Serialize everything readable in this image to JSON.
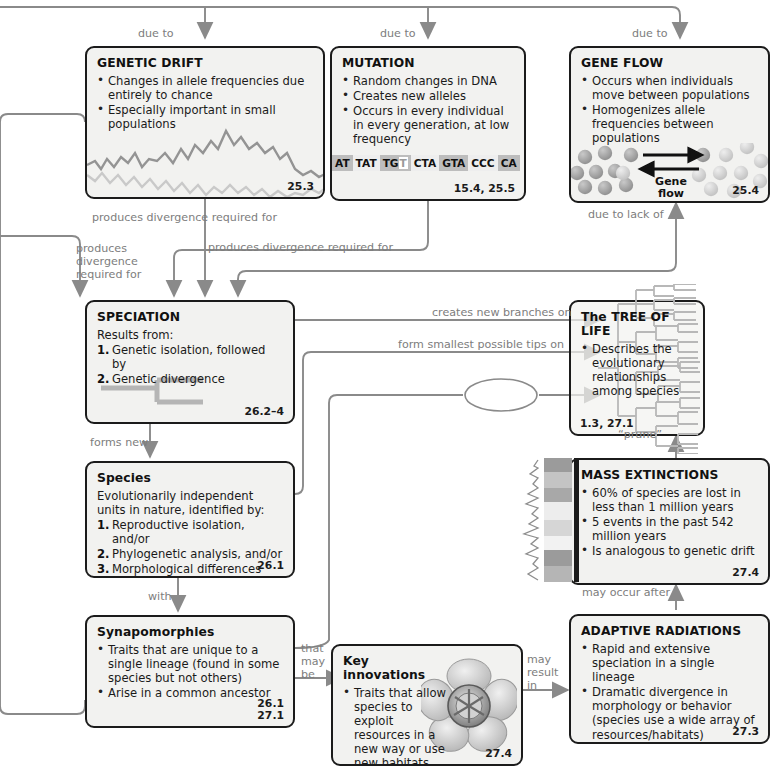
{
  "diagram": {
    "colors": {
      "box_border": "#1b1b1b",
      "box_fill": "#f2f2f0",
      "connector": "#8a8a8a",
      "label_text": "#7d7d7d",
      "body_text": "#1a1a1a"
    }
  },
  "boxes": {
    "genetic_drift": {
      "title": "GENETIC DRIFT",
      "bullets": [
        "Changes in allele frequencies due entirely to chance",
        "Especially important in small populations"
      ],
      "section": "25.3"
    },
    "mutation": {
      "title": "MUTATION",
      "bullets": [
        "Random changes in DNA",
        "Creates new alleles",
        "Occurs in every individual in every generation, at low frequency"
      ],
      "dna_codons": [
        "AT",
        "TAT",
        "TG",
        "CTA",
        "GTA",
        "CCC",
        "CA"
      ],
      "dna_highlight": "T",
      "section": "15.4, 25.5"
    },
    "gene_flow": {
      "title": "GENE FLOW",
      "bullets": [
        "Occurs when individuals move between populations",
        "Homogenizes allele frequencies between populations"
      ],
      "graphic_label": "Gene\nflow",
      "section": "25.4"
    },
    "speciation": {
      "title": "SPECIATION",
      "lead": "Results from:",
      "numbered": [
        "Genetic isolation, followed by",
        "Genetic divergence"
      ],
      "section": "26.2–4"
    },
    "tree_of_life": {
      "title": "The TREE OF LIFE",
      "bullets": [
        "Describes the evolutionary relationships among species"
      ],
      "section": "1.3, 27.1"
    },
    "species": {
      "title": "Species",
      "lead": "Evolutionarily independent units in nature, identified by:",
      "numbered": [
        "Reproductive isolation, and/or",
        "Phylogenetic analysis, and/or",
        "Morphological differences"
      ],
      "section": "26.1"
    },
    "mass_extinctions": {
      "title": "MASS EXTINCTIONS",
      "bullets": [
        "60% of species are lost in less than 1 million years",
        "5 events in the past 542 million years",
        "Is analogous to genetic drift"
      ],
      "section": "27.4"
    },
    "synapomorphies": {
      "title": "Synapomorphies",
      "bullets": [
        "Traits that are unique to a single lineage (found in some species but not others)",
        "Arise in a common ancestor"
      ],
      "section": "26.1\n27.1"
    },
    "key_innovations": {
      "title": "Key innovations",
      "bullets": [
        "Traits that allow species to exploit resources in a new way or use new habitats"
      ],
      "section": "27.4"
    },
    "adaptive_radiations": {
      "title": "ADAPTIVE RADIATIONS",
      "bullets": [
        "Rapid and extensive speciation in a single lineage",
        "Dramatic divergence in morphology or behavior (species use a wide array of resources/habitats)"
      ],
      "section": "27.3"
    }
  },
  "connector_labels": {
    "due_to_drift": "due to",
    "due_to_mutation": "due to",
    "due_to_gene_flow": "due to",
    "due_to_lack_of": "due to lack of",
    "produces_divergence_top": "produces divergence required for",
    "produces_divergence_left": "produces\ndivergence\nrequired for",
    "produces_divergence_mid": "produces divergence required for",
    "creates_new_branches_on": "creates new branches on",
    "form_smallest_tips_on": "form smallest possible tips on",
    "prune": "“prune”",
    "forms_new": "forms new",
    "with": "with",
    "that_may_be": "that\nmay\nbe",
    "may_result_in": "may\nresult\nin",
    "may_occur_after": "may occur after",
    "blank_ellipse": ""
  }
}
